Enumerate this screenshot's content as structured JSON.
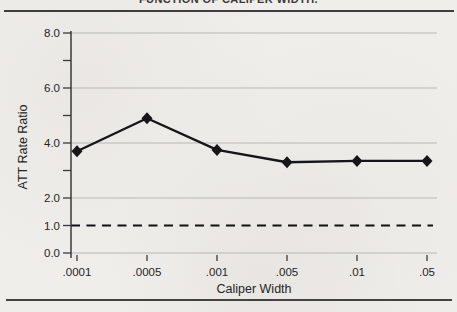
{
  "figure": {
    "title": "FUNCTION OF CALIPER WIDTH."
  },
  "chart_data": {
    "type": "line",
    "title": "FUNCTION OF CALIPER WIDTH.",
    "categories": [
      ".0001",
      ".0005",
      ".001",
      ".005",
      ".01",
      ".05"
    ],
    "series": [
      {
        "name": "ATT Rate Ratio",
        "values": [
          3.7,
          4.9,
          3.75,
          3.3,
          3.35,
          3.35
        ]
      }
    ],
    "xlabel": "Caliper Width",
    "ylabel": "ATT Rate Ratio",
    "ylim": [
      0,
      8
    ],
    "y_ticks": [
      0,
      1,
      2,
      3,
      4,
      5,
      6,
      7,
      8
    ],
    "y_tick_labels": [
      {
        "v": 0,
        "label": "0.0"
      },
      {
        "v": 1,
        "label": "1.0"
      },
      {
        "v": 2,
        "label": "2.0"
      },
      {
        "v": 4,
        "label": "4.0"
      },
      {
        "v": 6,
        "label": "6.0"
      },
      {
        "v": 8,
        "label": "8.0"
      }
    ],
    "gridline_values": [
      0,
      2,
      4,
      6,
      8
    ],
    "grid": "horizontal-only",
    "legend": "none",
    "marker": "diamond",
    "reference_line": {
      "value": 1.0,
      "style": "dashed"
    },
    "colors": {
      "line": "#161616",
      "reference": "#111111",
      "grid": "#b9b7b2",
      "axis": "#3a3a3a",
      "text": "#242424",
      "paper": "#f0eeea"
    }
  }
}
